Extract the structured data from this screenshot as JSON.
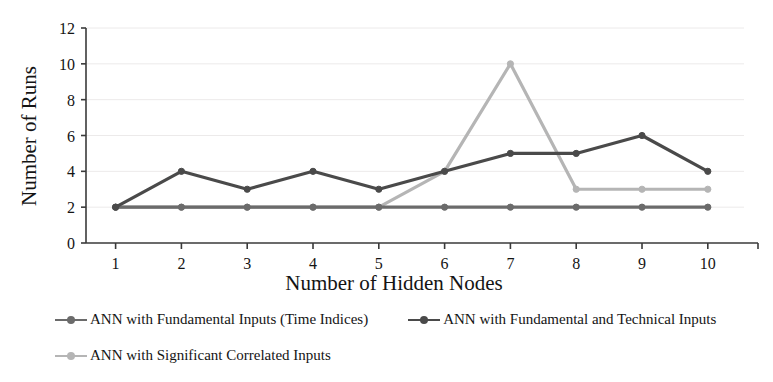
{
  "chart_data": {
    "type": "line",
    "title": "",
    "xlabel": "Number of Hidden Nodes",
    "ylabel": "Number of Runs",
    "categories": [
      1,
      2,
      3,
      4,
      5,
      6,
      7,
      8,
      9,
      10
    ],
    "x": [
      1,
      2,
      3,
      4,
      5,
      6,
      7,
      8,
      9,
      10
    ],
    "xtick_labels": [
      "1",
      "2",
      "3",
      "4",
      "5",
      "6",
      "7",
      "8",
      "9",
      "10"
    ],
    "ytick_labels": [
      "0",
      "2",
      "4",
      "6",
      "8",
      "10",
      "12"
    ],
    "yticks": [
      0,
      2,
      4,
      6,
      8,
      10,
      12
    ],
    "xlim": [
      0.55,
      10.55
    ],
    "ylim": [
      0,
      12
    ],
    "grid": true,
    "grid_axis": "y",
    "legend_position": "below-plot",
    "series": [
      {
        "name": "ANN with Fundamental Inputs (Time Indices)",
        "color": "#6b6b6b",
        "values": [
          2,
          2,
          2,
          2,
          2,
          2,
          2,
          2,
          2,
          2
        ]
      },
      {
        "name": "ANN with Fundamental and Technical Inputs",
        "color": "#4a4a4a",
        "values": [
          2,
          4,
          3,
          4,
          3,
          4,
          5,
          5,
          6,
          4
        ]
      },
      {
        "name": "ANN with Significant Correlated Inputs",
        "color": "#b5b5b5",
        "values": [
          2,
          2,
          2,
          2,
          2,
          4,
          10,
          3,
          3,
          3
        ]
      }
    ]
  },
  "axes": {
    "xlabel": "Number of Hidden Nodes",
    "ylabel": "Number of Runs",
    "axis_color": "#3a3a3a",
    "grid_color": "#eceaea"
  },
  "legend": {
    "items": [
      {
        "label": "ANN with Fundamental Inputs (Time Indices)",
        "color": "#6b6b6b"
      },
      {
        "label": "ANN with Fundamental and Technical Inputs",
        "color": "#4a4a4a"
      },
      {
        "label": "ANN with Significant Correlated Inputs",
        "color": "#b5b5b5"
      }
    ]
  }
}
